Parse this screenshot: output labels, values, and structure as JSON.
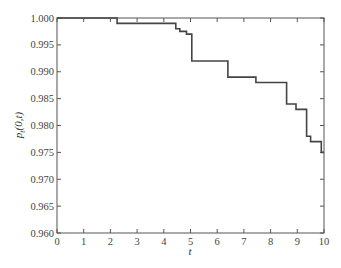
{
  "chart_data": {
    "type": "line",
    "subtype": "step",
    "title": "",
    "xlabel": "t",
    "ylabel": "p_t(0,t)",
    "xlim": [
      0,
      10
    ],
    "ylim": [
      0.96,
      1.0
    ],
    "x_ticks": [
      "0",
      "1",
      "2",
      "3",
      "4",
      "5",
      "6",
      "7",
      "8",
      "9",
      "10"
    ],
    "y_ticks": [
      "0.960",
      "0.965",
      "0.970",
      "0.975",
      "0.980",
      "0.985",
      "0.990",
      "0.995",
      "1.000"
    ],
    "grid": false,
    "legend": null,
    "line_color": "#444444",
    "series": [
      {
        "name": "p_t(0,t)",
        "x": [
          0,
          2.25,
          2.25,
          4.45,
          4.45,
          4.6,
          4.6,
          4.85,
          4.85,
          5.05,
          5.05,
          6.4,
          6.4,
          7.45,
          7.45,
          8.6,
          8.6,
          8.95,
          8.95,
          9.35,
          9.35,
          9.5,
          9.5,
          9.9,
          9.9,
          10
        ],
        "y": [
          1.0,
          1.0,
          0.999,
          0.999,
          0.998,
          0.998,
          0.9975,
          0.9975,
          0.997,
          0.997,
          0.992,
          0.992,
          0.989,
          0.989,
          0.988,
          0.988,
          0.984,
          0.984,
          0.983,
          0.983,
          0.978,
          0.978,
          0.977,
          0.977,
          0.975,
          0.975
        ]
      }
    ]
  }
}
